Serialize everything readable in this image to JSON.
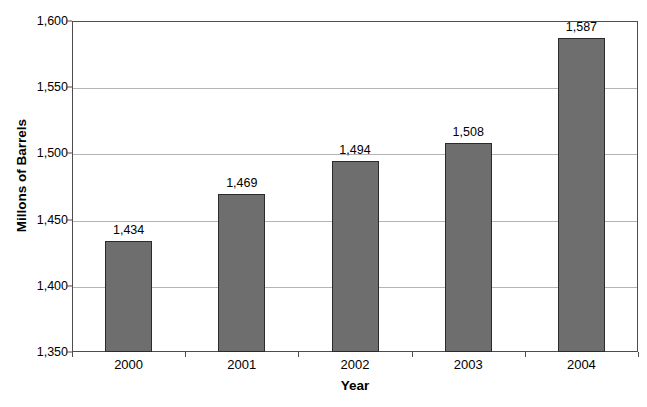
{
  "chart_data": {
    "type": "bar",
    "title": "",
    "xlabel": "Year",
    "ylabel": "Millons of Barrels",
    "categories": [
      "2000",
      "2001",
      "2002",
      "2003",
      "2004"
    ],
    "values": [
      1434,
      1469,
      1494,
      1508,
      1587
    ],
    "value_labels": [
      "1,434",
      "1,469",
      "1,494",
      "1,508",
      "1,587"
    ],
    "ylim": [
      1350,
      1600
    ],
    "ytick_values": [
      1350,
      1400,
      1450,
      1500,
      1550,
      1600
    ],
    "ytick_labels": [
      "1,350",
      "1,400",
      "1,450",
      "1,500",
      "1,550",
      "1,600"
    ],
    "grid": true,
    "legend": false,
    "legend_position": "none",
    "series": [
      {
        "name": "Millons of Barrels",
        "values": [
          1434,
          1469,
          1494,
          1508,
          1587
        ]
      }
    ]
  },
  "colors": {
    "bar_fill": "#6e6e6e",
    "bar_border": "#2b2b2b",
    "gridline": "#b5b5b5",
    "frame": "#4d4d4d",
    "background": "#ffffff",
    "text": "#000000"
  }
}
